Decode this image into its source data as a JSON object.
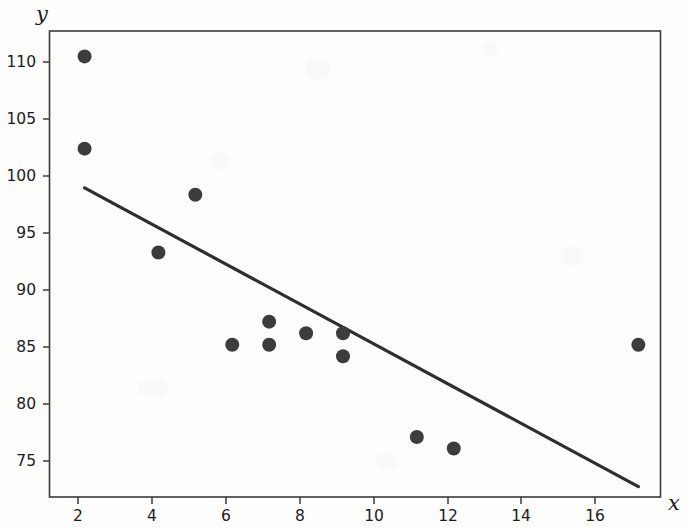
{
  "chart_data": {
    "type": "scatter",
    "title": "",
    "xlabel": "x",
    "ylabel": "y",
    "xlim": [
      1.05,
      17.6
    ],
    "ylim": [
      72.8,
      113.2
    ],
    "grid": false,
    "legend": null,
    "x_ticks": [
      2,
      4,
      6,
      8,
      10,
      12,
      14,
      16
    ],
    "y_ticks": [
      75,
      80,
      85,
      90,
      95,
      100,
      105,
      110
    ],
    "x_tick_labels": [
      "2",
      "4",
      "6",
      "8",
      "10",
      "12",
      "14",
      "16"
    ],
    "y_tick_labels": [
      "75",
      "80",
      "85",
      "90",
      "95",
      "100",
      "105",
      "110"
    ],
    "x": [
      2,
      2,
      4,
      5,
      6,
      7,
      7,
      8,
      9,
      9,
      11,
      12,
      17
    ],
    "y": [
      111,
      103,
      94,
      99,
      86,
      88,
      86,
      87,
      87,
      85,
      78,
      77,
      86
    ],
    "points": [
      {
        "x": 2,
        "y": 111
      },
      {
        "x": 2,
        "y": 103
      },
      {
        "x": 4,
        "y": 94
      },
      {
        "x": 5,
        "y": 99
      },
      {
        "x": 6,
        "y": 86
      },
      {
        "x": 7,
        "y": 88
      },
      {
        "x": 7,
        "y": 86
      },
      {
        "x": 8,
        "y": 87
      },
      {
        "x": 9,
        "y": 87
      },
      {
        "x": 9,
        "y": 85
      },
      {
        "x": 11,
        "y": 78
      },
      {
        "x": 12,
        "y": 77
      },
      {
        "x": 17,
        "y": 86
      }
    ],
    "marker": {
      "shape": "circle",
      "size": 9,
      "color": "#3c3c3c"
    },
    "series": [
      {
        "name": "regression-line",
        "type": "line",
        "color": "#2e2e2e",
        "endpoints": [
          {
            "x": 2,
            "y": 99.6
          },
          {
            "x": 17,
            "y": 73.7
          }
        ],
        "slope": -1.727,
        "intercept": 103.05
      }
    ]
  },
  "figure": {
    "background": "#fdfdfc",
    "axis_color": "#3a3a3a",
    "text_color": "#1b1b1b"
  }
}
